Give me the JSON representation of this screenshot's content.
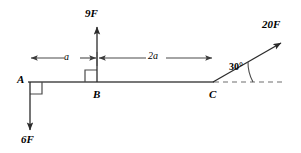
{
  "diagram": {
    "kind": "statics-beam-free-body-diagram",
    "canvas": {
      "width": 301,
      "height": 153,
      "background": "#ffffff",
      "stroke": "#3c3c3c"
    },
    "points": [
      {
        "id": "A",
        "label": "A",
        "x": 28,
        "y": 82
      },
      {
        "id": "B",
        "label": "B",
        "x": 97,
        "y": 82
      },
      {
        "id": "C",
        "label": "C",
        "x": 213,
        "y": 82
      }
    ],
    "beam": {
      "from_x": 28,
      "to_x": 213,
      "y": 82
    },
    "forces": [
      {
        "id": "force-at-a",
        "label": "6F",
        "magnitude": 6,
        "unit": "F",
        "direction": "down",
        "angle_deg": 270,
        "applied_at": "A",
        "from": {
          "x": 30,
          "y": 82
        },
        "to": {
          "x": 30,
          "y": 132
        }
      },
      {
        "id": "force-at-b",
        "label": "9F",
        "magnitude": 9,
        "unit": "F",
        "direction": "up",
        "angle_deg": 90,
        "applied_at": "B",
        "from": {
          "x": 97,
          "y": 82
        },
        "to": {
          "x": 97,
          "y": 25
        }
      },
      {
        "id": "force-at-c",
        "label": "20F",
        "magnitude": 20,
        "unit": "F",
        "direction": "up-right",
        "angle_deg": 30,
        "applied_at": "C",
        "from": {
          "x": 213,
          "y": 82
        },
        "to": {
          "x": 283,
          "y": 42
        }
      }
    ],
    "angle_marker": {
      "label": "30°",
      "value_deg": 30,
      "vertex": "C",
      "reference": "horizontal-dashed-line"
    },
    "dimensions": [
      {
        "id": "dim-a",
        "label": "a",
        "from_x": 30,
        "to_x": 97,
        "y": 58
      },
      {
        "id": "dim-2a",
        "label": "2a",
        "from_x": 97,
        "to_x": 213,
        "y": 58
      }
    ],
    "right_angle_markers": [
      {
        "id": "right-angle-at-a",
        "at": "A",
        "size": 12
      },
      {
        "id": "right-angle-at-b",
        "at": "B",
        "size": 12
      }
    ],
    "dashed_reference_line": {
      "from_x": 213,
      "to_x": 285,
      "y": 82
    }
  }
}
